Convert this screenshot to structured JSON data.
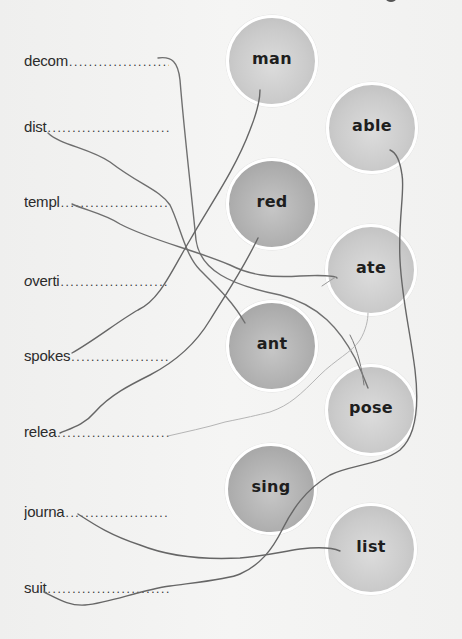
{
  "exercise": {
    "type": "word-ending matching",
    "stems": [
      {
        "id": "decom",
        "text": "decom"
      },
      {
        "id": "dist",
        "text": "dist"
      },
      {
        "id": "templ",
        "text": "templ"
      },
      {
        "id": "overti",
        "text": "overti"
      },
      {
        "id": "spokes",
        "text": "spokes"
      },
      {
        "id": "relea",
        "text": "relea"
      },
      {
        "id": "journa",
        "text": "journa"
      },
      {
        "id": "suit",
        "text": "suit"
      }
    ],
    "dot_leader": "........................................",
    "endings": [
      {
        "id": "man",
        "text": "man"
      },
      {
        "id": "able",
        "text": "able"
      },
      {
        "id": "red",
        "text": "red"
      },
      {
        "id": "ate",
        "text": "ate"
      },
      {
        "id": "ant",
        "text": "ant"
      },
      {
        "id": "pose",
        "text": "pose"
      },
      {
        "id": "sing",
        "text": "sing"
      },
      {
        "id": "list",
        "text": "list"
      }
    ],
    "connections": [
      {
        "from": "decom",
        "to": "pose"
      },
      {
        "from": "dist",
        "to": "ant"
      },
      {
        "from": "templ",
        "to": "ate"
      },
      {
        "from": "spokes",
        "to": "man"
      },
      {
        "from": "relea",
        "to": "red"
      },
      {
        "from": "journa",
        "to": "list"
      },
      {
        "from": "suit",
        "to": "able"
      },
      {
        "from": "relea",
        "to": "ate",
        "faint": true
      }
    ]
  },
  "colors": {
    "background": "#f2f2f1",
    "bubble_light": "#cbcbcb",
    "bubble_dark": "#b0b0b0",
    "bubble_border": "#ffffff",
    "string": "#6e6e6e",
    "string_faint": "#b8b8b8",
    "text": "#2b2b2b"
  }
}
